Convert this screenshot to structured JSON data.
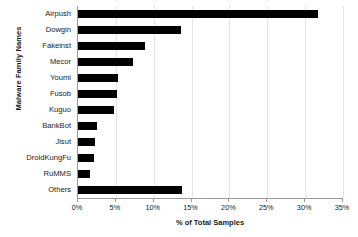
{
  "chart_data": {
    "type": "bar",
    "orientation": "horizontal",
    "title": "",
    "xlabel": "% of Total Samples",
    "ylabel": "Malware Family Names",
    "categories": [
      "Airpush",
      "Dowgin",
      "Fakeinst",
      "Mecor",
      "Youmi",
      "Fusob",
      "Kuguo",
      "BankBot",
      "Jisut",
      "DroidKungFu",
      "RuMMS",
      "Others"
    ],
    "values": [
      31.7,
      13.6,
      8.9,
      7.2,
      5.3,
      5.1,
      4.8,
      2.5,
      2.2,
      2.1,
      1.6,
      13.8
    ],
    "xlim": [
      0,
      35
    ],
    "xtick_values": [
      0,
      5,
      10,
      15,
      20,
      25,
      30,
      35
    ],
    "xtick_labels": [
      "0%",
      "5%",
      "10%",
      "15%",
      "20%",
      "25%",
      "30%",
      "35%"
    ],
    "grid": true,
    "grid_axis": "x",
    "legend": null,
    "bar_color": "#000000",
    "gridline_color": "#e4e4e4",
    "axis_color": "#9a9a9a",
    "background_color": "#ffffff"
  }
}
